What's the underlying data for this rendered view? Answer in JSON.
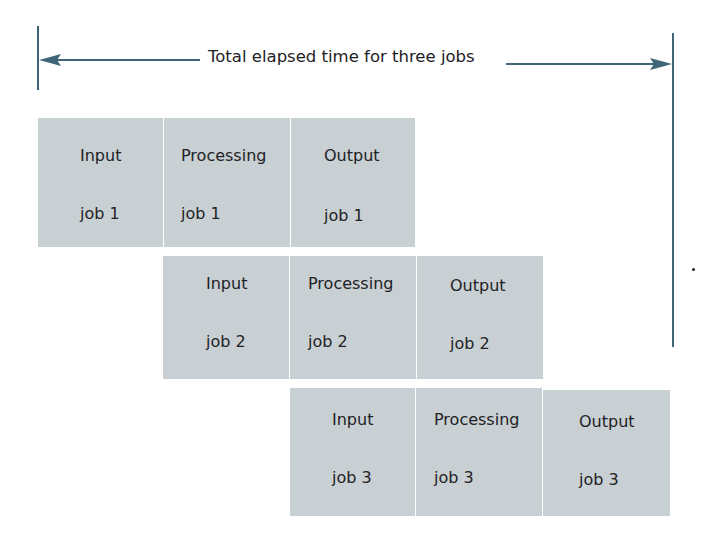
{
  "diagram": {
    "title": "Total elapsed time for three jobs",
    "colors": {
      "box_fill": "#c9d0d3",
      "arrow": "#3f6678",
      "text": "#1e2226"
    },
    "rows": [
      {
        "job": "job 1",
        "cells": [
          {
            "stage": "Input",
            "job": "job 1"
          },
          {
            "stage": "Processing",
            "job": "job 1"
          },
          {
            "stage": "Output",
            "job": "job 1"
          }
        ]
      },
      {
        "job": "job 2",
        "cells": [
          {
            "stage": "Input",
            "job": "job 2"
          },
          {
            "stage": "Processing",
            "job": "job 2"
          },
          {
            "stage": "Output",
            "job": "job 2"
          }
        ]
      },
      {
        "job": "job 3",
        "cells": [
          {
            "stage": "Input",
            "job": "job 3"
          },
          {
            "stage": "Processing",
            "job": "job 3"
          },
          {
            "stage": "Output",
            "job": "job 3"
          }
        ]
      }
    ]
  }
}
